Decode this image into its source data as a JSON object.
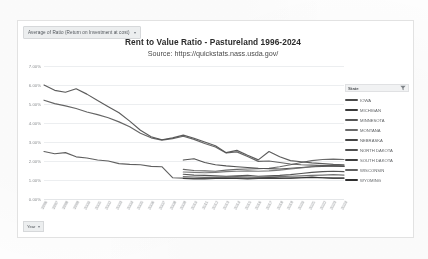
{
  "header": {
    "measure_pill_label": "Average of Ratio (Return on Investment at cost)",
    "measure_pill_caret": "▾"
  },
  "footer": {
    "year_filter_label": "Year",
    "year_filter_caret": "▾"
  },
  "legend": {
    "header_label": "State",
    "filter_icon": "filter-icon"
  },
  "chart_data": {
    "type": "line",
    "title": "Rent to Value Ratio - Pastureland 1996-2024",
    "subtitle": "Source: https://quickstats.nass.usda.gov/",
    "xlabel": "",
    "ylabel": "",
    "ylim": [
      0,
      7
    ],
    "ytick_labels": [
      "7.00%",
      "6.00%",
      "5.00%",
      "4.00%",
      "3.00%",
      "2.00%",
      "1.00%",
      "0.00%"
    ],
    "ytick_values": [
      7,
      6,
      5,
      4,
      3,
      2,
      1,
      0
    ],
    "grid": true,
    "legend_position": "right",
    "x": [
      1996,
      1997,
      1998,
      1999,
      2000,
      2001,
      2002,
      2003,
      2004,
      2005,
      2006,
      2007,
      2008,
      2009,
      2010,
      2011,
      2012,
      2013,
      2014,
      2015,
      2016,
      2017,
      2018,
      2019,
      2020,
      2021,
      2022,
      2023,
      2024
    ],
    "series": [
      {
        "name": "IOWA",
        "color": "#4a4a4a",
        "values": [
          2.5,
          2.38,
          2.44,
          2.22,
          2.16,
          2.05,
          2.0,
          1.86,
          1.82,
          1.8,
          1.72,
          1.7,
          1.12,
          1.1,
          1.09,
          1.1,
          1.12,
          1.1,
          1.12,
          1.1,
          1.12,
          1.14,
          1.12,
          1.1,
          1.12,
          1.15,
          1.12,
          1.1,
          1.1
        ]
      },
      {
        "name": "MICHIGAN",
        "color": "#3a3a3a",
        "values": [
          null,
          null,
          null,
          null,
          null,
          null,
          null,
          null,
          null,
          null,
          null,
          null,
          null,
          2.05,
          2.12,
          1.92,
          1.8,
          1.74,
          1.7,
          1.66,
          1.62,
          1.6,
          1.58,
          1.62,
          1.66,
          1.7,
          1.72,
          1.74,
          1.72
        ]
      },
      {
        "name": "MINNESOTA",
        "color": "#555555",
        "values": [
          null,
          null,
          null,
          null,
          null,
          null,
          null,
          null,
          null,
          null,
          null,
          null,
          null,
          1.56,
          1.5,
          1.48,
          1.46,
          1.52,
          1.56,
          1.58,
          1.6,
          1.62,
          1.7,
          1.8,
          1.92,
          2.02,
          2.08,
          2.1,
          2.08
        ]
      },
      {
        "name": "MONTANA",
        "color": "#6a6a6a",
        "values": [
          null,
          null,
          null,
          null,
          null,
          null,
          null,
          null,
          null,
          null,
          null,
          null,
          null,
          1.42,
          1.4,
          1.38,
          1.4,
          1.44,
          1.46,
          1.48,
          1.46,
          1.48,
          1.52,
          1.58,
          1.64,
          1.7,
          1.74,
          1.76,
          1.74
        ]
      },
      {
        "name": "NEBRASKA",
        "color": "#454545",
        "values": [
          6.0,
          5.72,
          5.62,
          5.8,
          5.52,
          5.18,
          4.86,
          4.54,
          4.1,
          3.62,
          3.28,
          3.12,
          3.22,
          3.36,
          3.2,
          3.0,
          2.8,
          2.44,
          2.56,
          2.3,
          2.06,
          2.5,
          2.22,
          2.02,
          1.96,
          1.9,
          1.86,
          1.82,
          1.8
        ]
      },
      {
        "name": "NORTH DAKOTA",
        "color": "#505050",
        "values": [
          5.2,
          5.02,
          4.9,
          4.76,
          4.58,
          4.44,
          4.28,
          4.06,
          3.8,
          3.46,
          3.22,
          3.1,
          3.18,
          3.3,
          3.14,
          2.92,
          2.74,
          2.42,
          2.48,
          2.24,
          1.98,
          2.0,
          1.92,
          1.84,
          1.8,
          1.78,
          1.76,
          1.74,
          1.72
        ]
      },
      {
        "name": "SOUTH DAKOTA",
        "color": "#3f3f3f",
        "values": [
          null,
          null,
          null,
          null,
          null,
          null,
          null,
          null,
          null,
          null,
          null,
          null,
          null,
          1.3,
          1.26,
          1.24,
          1.22,
          1.2,
          1.22,
          1.24,
          1.2,
          1.22,
          1.24,
          1.28,
          1.34,
          1.4,
          1.44,
          1.46,
          1.44
        ]
      },
      {
        "name": "WISCONSIN",
        "color": "#606060",
        "values": [
          null,
          null,
          null,
          null,
          null,
          null,
          null,
          null,
          null,
          null,
          null,
          null,
          null,
          1.18,
          1.16,
          1.14,
          1.14,
          1.16,
          1.18,
          1.16,
          1.14,
          1.16,
          1.18,
          1.2,
          1.22,
          1.24,
          1.26,
          1.28,
          1.26
        ]
      },
      {
        "name": "WYOMING",
        "color": "#2f2f2f",
        "values": [
          null,
          null,
          null,
          null,
          null,
          null,
          null,
          null,
          null,
          null,
          null,
          null,
          null,
          1.08,
          1.06,
          1.06,
          1.08,
          1.1,
          1.08,
          1.06,
          1.08,
          1.1,
          1.08,
          1.1,
          1.12,
          1.14,
          1.12,
          1.1,
          1.1
        ]
      }
    ]
  }
}
